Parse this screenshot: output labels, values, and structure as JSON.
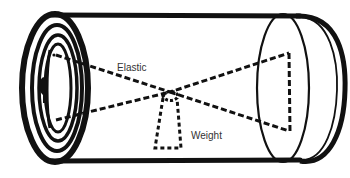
{
  "diagram": {
    "labels": {
      "elastic": "Elastic",
      "weight": "Weight"
    },
    "colors": {
      "ink": "#111111",
      "label": "#333333",
      "background": "#ffffff"
    }
  }
}
